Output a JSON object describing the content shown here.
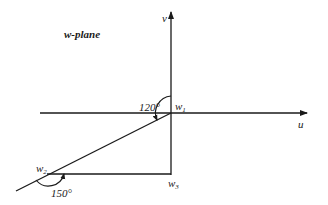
{
  "diagram": {
    "title": "w-plane",
    "axes": {
      "horizontal_label": "u",
      "vertical_label": "v"
    },
    "points": [
      {
        "id": "w1",
        "label": "w",
        "subscript": "1"
      },
      {
        "id": "w2",
        "label": "w",
        "subscript": "2"
      },
      {
        "id": "w3",
        "label": "w",
        "subscript": "3"
      }
    ],
    "angles": [
      {
        "at": "w1",
        "label": "120°"
      },
      {
        "at": "w2",
        "label": "150°"
      }
    ],
    "colors": {
      "ink": "#1a1a1a",
      "background": "#ffffff"
    }
  }
}
